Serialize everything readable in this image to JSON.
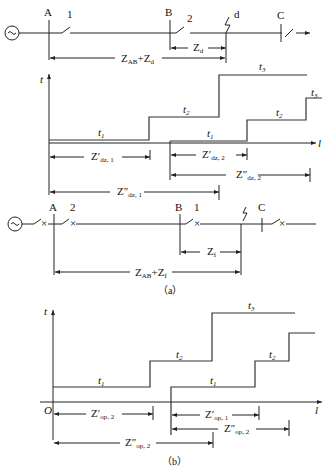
{
  "diagram_a": {
    "line": {
      "source": "~",
      "buses": [
        "A",
        "B",
        "C"
      ],
      "breakers": [
        "1",
        "2"
      ],
      "fault": "d",
      "dims": {
        "z_d": {
          "main": "Z",
          "sub": "d"
        },
        "z_ab_zd": {
          "main": "Z",
          "sub1": "AB",
          "plus": "+Z",
          "sub2": "d"
        }
      }
    },
    "chart": {
      "y_axis": "t",
      "x_axis": "l",
      "relay1_steps": [
        "t1",
        "t2",
        "t3"
      ],
      "relay2_steps": [
        "t1",
        "t2",
        "t3"
      ],
      "t_main": "t",
      "t1_sub": "1",
      "t2_sub": "2",
      "t3_sub": "3",
      "dims": {
        "zdz1p": {
          "main": "Z′",
          "sub": "dz, 1"
        },
        "zdz2p": {
          "main": "Z′",
          "sub": "dz, 2"
        },
        "zdz2pp": {
          "main": "Z″",
          "sub": "dz, 2"
        },
        "zdz1pp": {
          "main": "Z″",
          "sub": "dz, 1"
        }
      }
    },
    "line2": {
      "source": "~",
      "buses": [
        "A",
        "B",
        "C"
      ],
      "breakers": [
        "2",
        "1"
      ],
      "dims": {
        "z_f": {
          "main": "Z",
          "sub": "f"
        },
        "z_ab_zf": {
          "main": "Z",
          "sub1": "AB",
          "plus": "+Z",
          "sub2": "f"
        }
      }
    },
    "caption": "（a）"
  },
  "diagram_b": {
    "chart": {
      "y_axis": "t",
      "x_axis": "l",
      "origin": "O",
      "dims": {
        "zop2p": {
          "main": "Z′",
          "sub": "op, 2"
        },
        "zop1p": {
          "main": "Z′",
          "sub": "op, 1"
        },
        "zop2pp_r": {
          "main": "Z″",
          "sub": "op, 2"
        },
        "zop2pp": {
          "main": "Z″",
          "sub": "op, 2"
        }
      }
    },
    "caption": "（b）"
  },
  "colors": {
    "line": "#222222",
    "background": "#ffffff"
  }
}
